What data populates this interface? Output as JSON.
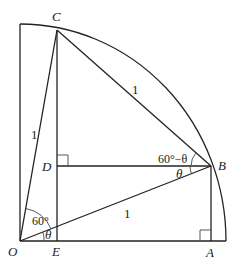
{
  "diagram": {
    "points": {
      "O": {
        "label": "O",
        "x": 20,
        "y": 241
      },
      "E": {
        "label": "E",
        "x": 57,
        "y": 241
      },
      "A": {
        "label": "A",
        "x": 211,
        "y": 241
      },
      "B": {
        "label": "B",
        "x": 211,
        "y": 166
      },
      "C": {
        "label": "C",
        "x": 57,
        "y": 30
      },
      "D": {
        "label": "D",
        "x": 57,
        "y": 166
      }
    },
    "segment_labels": {
      "OC": "1",
      "CB": "1",
      "OB": "1"
    },
    "angle_labels": {
      "COB": "60°",
      "BOE": "θ",
      "CBD": "60°−θ",
      "DBO": "θ"
    },
    "colors": {
      "stroke": "#222222",
      "background": "#ffffff"
    }
  }
}
